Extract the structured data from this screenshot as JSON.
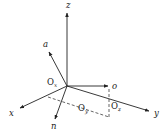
{
  "diagram": {
    "type": "3d-coordinate-frame",
    "origin": [
      67,
      86
    ],
    "axes": [
      {
        "id": "z",
        "label": "z",
        "end": [
          67,
          13
        ],
        "label_pos": [
          66,
          8
        ]
      },
      {
        "id": "x",
        "label": "x",
        "end": [
          20,
          108
        ],
        "label_pos": [
          9,
          116
        ]
      },
      {
        "id": "y",
        "label": "y",
        "end": [
          149,
          111
        ],
        "label_pos": [
          154,
          116
        ]
      }
    ],
    "vectors": [
      {
        "id": "a",
        "label": "a",
        "end": [
          49,
          52
        ],
        "label_pos": [
          43,
          47
        ]
      },
      {
        "id": "o",
        "label": "o",
        "end": [
          108,
          86
        ],
        "label_pos": [
          112,
          89
        ]
      },
      {
        "id": "n",
        "label": "n",
        "end": [
          55,
          119
        ],
        "label_pos": [
          51,
          129
        ]
      }
    ],
    "offsets": [
      {
        "id": "Ox",
        "main": "O",
        "sub": "x",
        "pos": [
          47,
          85
        ]
      },
      {
        "id": "Oy",
        "main": "O",
        "sub": "y",
        "pos": [
          78,
          111
        ]
      },
      {
        "id": "Oz",
        "main": "O",
        "sub": "z",
        "pos": [
          111,
          109
        ]
      }
    ],
    "dashed_lines": [
      {
        "from": [
          109,
          89
        ],
        "to": [
          109,
          117
        ]
      },
      {
        "from": [
          48,
          97
        ],
        "to": [
          109,
          117
        ]
      }
    ]
  }
}
